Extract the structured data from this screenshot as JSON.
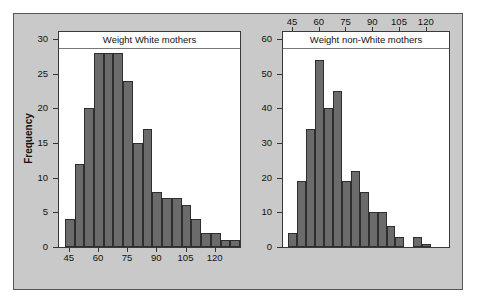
{
  "figure": {
    "background_color": "#ffffff",
    "panel_color": "#c9c9c9",
    "bar_color": "#6b6b6b",
    "bar_edge_color": "#2e2e2e",
    "plot_background": "#ffffff",
    "ylabel": "Frequency"
  },
  "chart_data": [
    {
      "type": "bar",
      "id": "white-mothers",
      "title": "Weight White mothers",
      "xlabel": "",
      "ylabel": "Frequency",
      "xlim": [
        40,
        133
      ],
      "ylim": [
        0,
        31
      ],
      "ytick_labels": [
        "0",
        "5",
        "10",
        "15",
        "20",
        "25",
        "30"
      ],
      "ytick_values": [
        0,
        5,
        10,
        15,
        20,
        25,
        30
      ],
      "xtick_labels": [
        "45",
        "60",
        "75",
        "90",
        "105",
        "120"
      ],
      "xtick_values": [
        45,
        60,
        75,
        90,
        105,
        120
      ],
      "xaxis_position": "bottom",
      "grid": false,
      "legend": false,
      "bin_width": 5,
      "bin_starts": [
        43,
        48,
        53,
        58,
        63,
        68,
        73,
        78,
        83,
        88,
        93,
        98,
        103,
        108,
        113,
        118,
        123,
        128
      ],
      "categories": [
        "43-48",
        "48-53",
        "53-58",
        "58-63",
        "63-68",
        "68-73",
        "73-78",
        "78-83",
        "83-88",
        "88-93",
        "93-98",
        "98-103",
        "103-108",
        "108-113",
        "113-118",
        "118-123",
        "123-128",
        "128-133"
      ],
      "values": [
        4,
        12,
        20,
        28,
        28,
        28,
        24,
        15,
        17,
        8,
        7,
        7,
        6,
        4,
        2,
        2,
        1,
        1
      ]
    },
    {
      "type": "bar",
      "id": "non-white-mothers",
      "title": "Weight non-White mothers",
      "xlabel": "",
      "ylabel": "",
      "xlim": [
        40,
        133
      ],
      "ylim": [
        0,
        62
      ],
      "ytick_labels": [
        "0",
        "10",
        "20",
        "30",
        "40",
        "50",
        "60"
      ],
      "ytick_values": [
        0,
        10,
        20,
        30,
        40,
        50,
        60
      ],
      "xtick_labels": [
        "45",
        "60",
        "75",
        "90",
        "105",
        "120"
      ],
      "xtick_values": [
        45,
        60,
        75,
        90,
        105,
        120
      ],
      "xaxis_position": "top",
      "grid": false,
      "legend": false,
      "bin_width": 5,
      "bin_starts": [
        43,
        48,
        53,
        58,
        63,
        68,
        73,
        78,
        83,
        88,
        93,
        98,
        103,
        108,
        113,
        118
      ],
      "categories": [
        "43-48",
        "48-53",
        "53-58",
        "58-63",
        "63-68",
        "68-73",
        "73-78",
        "78-83",
        "83-88",
        "88-93",
        "93-98",
        "98-103",
        "103-108",
        "108-113",
        "113-118",
        "118-123"
      ],
      "values": [
        4,
        19,
        34,
        54,
        40,
        45,
        19,
        22,
        16,
        10,
        10,
        6,
        3,
        0,
        3,
        1
      ]
    }
  ]
}
